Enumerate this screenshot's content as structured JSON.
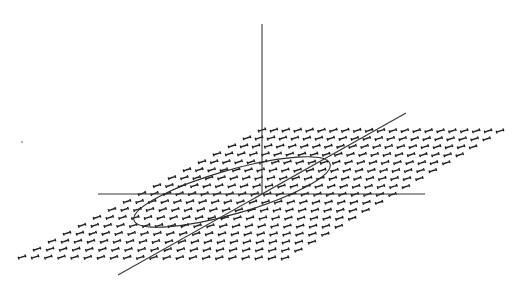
{
  "diagram": {
    "kind": "3d-coordinate-system-with-plane",
    "background": "#ffffff",
    "ink_color": "#2e2e2e",
    "axes": {
      "z": {
        "from": [
          262,
          24
        ],
        "to": [
          262,
          194
        ]
      },
      "x": {
        "from": [
          98,
          194
        ],
        "to": [
          425,
          194
        ]
      },
      "y": {
        "from": [
          118,
          275
        ],
        "to": [
          406,
          113
        ]
      }
    },
    "plane": {
      "fill_glyph": "dumbbell-mark",
      "corners": [
        [
          22,
          257
        ],
        [
          285,
          258
        ],
        [
          500,
          131
        ],
        [
          262,
          130
        ]
      ],
      "rows": 16,
      "cols": 20
    },
    "loop": {
      "kind": "tilted-ellipse",
      "center": [
        232,
        192
      ],
      "rx": 102,
      "ry": 22,
      "rotation_deg": -16
    },
    "specks": [
      [
        22,
        142
      ]
    ]
  }
}
